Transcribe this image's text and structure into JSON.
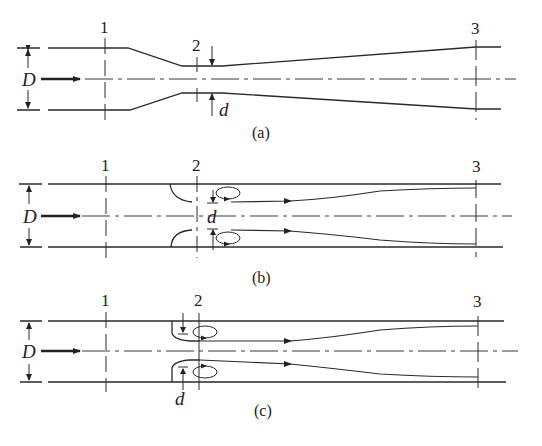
{
  "figure": {
    "panels": [
      {
        "id": "a",
        "caption": "(a)",
        "description": "Venturi meter",
        "stations": [
          "1",
          "2",
          "3"
        ],
        "dimension_large": "D",
        "dimension_small": "d"
      },
      {
        "id": "b",
        "caption": "(b)",
        "description": "Flow nozzle",
        "stations": [
          "1",
          "2",
          "3"
        ],
        "dimension_large": "D",
        "dimension_small": "d"
      },
      {
        "id": "c",
        "caption": "(c)",
        "description": "Orifice plate",
        "stations": [
          "1",
          "2",
          "3"
        ],
        "dimension_large": "D",
        "dimension_small": "d"
      }
    ]
  }
}
